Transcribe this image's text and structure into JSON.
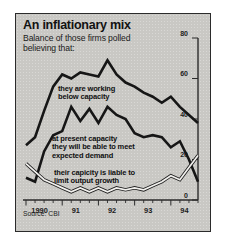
{
  "figure": {
    "title": "An inflationary mix",
    "subtitle_line1": "Balance of those firms polled",
    "subtitle_line2": "believing that:",
    "source": "Source: CBI"
  },
  "chart_data": {
    "type": "line",
    "title": "An inflationary mix",
    "subtitle": "Balance of those firms polled believing that:",
    "xlabel": "",
    "ylabel": "",
    "ylim": [
      0,
      80
    ],
    "yticks": [
      0,
      20,
      40,
      60,
      80
    ],
    "ytick_labels": [
      "0",
      "20",
      "40",
      "60",
      "80"
    ],
    "y_axis_position": "right",
    "grid": false,
    "legend": "inline-annotations",
    "source": "Source: CBI",
    "x": [
      "1990 Q1",
      "1990 Q2",
      "1990 Q3",
      "1990 Q4",
      "1991 Q1",
      "1991 Q2",
      "1991 Q3",
      "1991 Q4",
      "1992 Q1",
      "1992 Q2",
      "1992 Q3",
      "1992 Q4",
      "1993 Q1",
      "1993 Q2",
      "1993 Q3",
      "1993 Q4",
      "1994 Q1",
      "1994 Q2",
      "1994 Q3",
      "1994 Q4"
    ],
    "xtick_labels": [
      "1990",
      "91",
      "92",
      "93",
      "94"
    ],
    "series": [
      {
        "name": "they are working below capacity",
        "style": "solid-black",
        "annotation_lines": [
          "they are working",
          "below capacity"
        ],
        "values": [
          27,
          31,
          44,
          56,
          62,
          60,
          63,
          62,
          61,
          69,
          62,
          58,
          56,
          53,
          51,
          48,
          51,
          46,
          42,
          38
        ]
      },
      {
        "name": "at present capacity they will be able to meet expected demand",
        "style": "solid-black",
        "annotation_lines": [
          "at present capacity",
          "they will be able to meet",
          "expected demand"
        ],
        "values": [
          11,
          9,
          24,
          32,
          34,
          46,
          39,
          45,
          38,
          46,
          42,
          40,
          33,
          31,
          32,
          31,
          26,
          29,
          20,
          9
        ]
      },
      {
        "name": "their capicity is liable to limit output growth",
        "style": "white-outlined",
        "annotation_lines": [
          "their capicity is liable to",
          "limit output growth"
        ],
        "values": [
          18,
          14,
          10,
          8,
          6,
          4,
          6,
          4,
          6,
          4,
          6,
          5,
          6,
          5,
          7,
          9,
          12,
          10,
          16,
          22
        ]
      }
    ]
  }
}
